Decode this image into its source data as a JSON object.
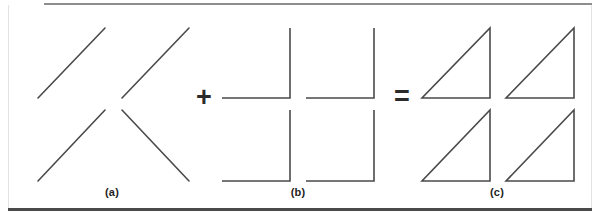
{
  "figure": {
    "background_color": "#ffffff",
    "stroke_color": "#4a4a4a",
    "operator_color": "#2b2b2b",
    "rule_top_color": "#8e8e8e",
    "rule_bottom_color": "#4a4a4a",
    "stroke_width": 1.6
  },
  "operators": [
    {
      "id": "plus",
      "symbol": "+",
      "name": "plus-operator"
    },
    {
      "id": "equals",
      "symbol": "=",
      "name": "equals-operator"
    }
  ],
  "captions": [
    {
      "id": "a",
      "label": "(a)"
    },
    {
      "id": "b",
      "label": "(b)"
    },
    {
      "id": "c",
      "label": "(c)"
    }
  ],
  "chart_data": {
    "type": "diagram",
    "xlabel": "",
    "ylabel": "",
    "canvas": {
      "width": 599,
      "height": 223
    },
    "panels": [
      {
        "id": "a",
        "label": "(a)",
        "caption_position": {
          "x": 112,
          "y": 193
        },
        "element_type": "diagonal-strokes",
        "element_count": 4,
        "elements": [
          {
            "name": "diagonal-top-left",
            "x1": 38,
            "y1": 98,
            "x2": 105,
            "y2": 28
          },
          {
            "name": "diagonal-top-right",
            "x1": 122,
            "y1": 98,
            "x2": 189,
            "y2": 28
          },
          {
            "name": "diagonal-bottom-left",
            "x1": 38,
            "y1": 181,
            "x2": 105,
            "y2": 110
          },
          {
            "name": "diagonal-bottom-right",
            "x1": 122,
            "y1": 110,
            "x2": 189,
            "y2": 181
          }
        ]
      },
      {
        "id": "b",
        "label": "(b)",
        "caption_position": {
          "x": 298,
          "y": 193
        },
        "element_type": "corner-brackets",
        "element_count": 4,
        "elements": [
          {
            "name": "corner-top-left",
            "points": "222,98 290,98 290,28"
          },
          {
            "name": "corner-top-right",
            "points": "306,98 374,98 374,28"
          },
          {
            "name": "corner-bottom-left",
            "points": "290,110 290,181 222,181"
          },
          {
            "name": "corner-bottom-right",
            "points": "374,110 374,181 306,181"
          }
        ]
      },
      {
        "id": "c",
        "label": "(c)",
        "caption_position": {
          "x": 497,
          "y": 193
        },
        "element_type": "right-triangles",
        "element_count": 4,
        "elements": [
          {
            "name": "triangle-top-left",
            "points": "422,98 490,98 490,28"
          },
          {
            "name": "triangle-top-right",
            "points": "506,98 574,98 574,28"
          },
          {
            "name": "triangle-bottom-left",
            "points": "422,181 490,181 490,110"
          },
          {
            "name": "triangle-bottom-right",
            "points": "574,110 574,181 506,181"
          }
        ]
      }
    ],
    "operators": [
      {
        "symbol": "+",
        "between": [
          "a",
          "b"
        ],
        "x": 204,
        "y": 98
      },
      {
        "symbol": "=",
        "between": [
          "b",
          "c"
        ],
        "x": 402,
        "y": 98
      }
    ],
    "rules": [
      {
        "name": "rule-top",
        "x1": 44,
        "y1": 4,
        "x2": 592,
        "y2": 4,
        "width": 2,
        "color": "#8e8e8e"
      },
      {
        "name": "rule-bottom",
        "x1": 8,
        "y1": 209,
        "x2": 592,
        "y2": 209,
        "width": 3,
        "color": "#4a4a4a"
      }
    ]
  }
}
